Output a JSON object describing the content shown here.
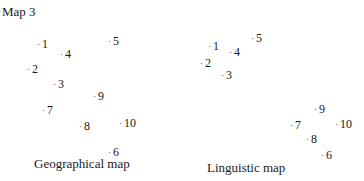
{
  "title": "Map 3",
  "maps": [
    {
      "caption": "Geographical map",
      "points": [
        {
          "label": "1",
          "x": 37,
          "y": 37
        },
        {
          "label": "2",
          "x": 27,
          "y": 62
        },
        {
          "label": "3",
          "x": 53,
          "y": 77
        },
        {
          "label": "4",
          "x": 60,
          "y": 47
        },
        {
          "label": "5",
          "x": 108,
          "y": 34
        },
        {
          "label": "6",
          "x": 108,
          "y": 145
        },
        {
          "label": "7",
          "x": 42,
          "y": 103
        },
        {
          "label": "8",
          "x": 79,
          "y": 119
        },
        {
          "label": "9",
          "x": 93,
          "y": 89
        },
        {
          "label": "10",
          "x": 119,
          "y": 116
        }
      ]
    },
    {
      "caption": "Linguistic map",
      "points": [
        {
          "label": "1",
          "x": 26,
          "y": 39
        },
        {
          "label": "2",
          "x": 18,
          "y": 56
        },
        {
          "label": "3",
          "x": 39,
          "y": 68
        },
        {
          "label": "4",
          "x": 47,
          "y": 45
        },
        {
          "label": "5",
          "x": 69,
          "y": 31
        },
        {
          "label": "6",
          "x": 139,
          "y": 148
        },
        {
          "label": "7",
          "x": 108,
          "y": 118
        },
        {
          "label": "8",
          "x": 124,
          "y": 132
        },
        {
          "label": "9",
          "x": 132,
          "y": 102
        },
        {
          "label": "10",
          "x": 153,
          "y": 117
        }
      ]
    }
  ]
}
